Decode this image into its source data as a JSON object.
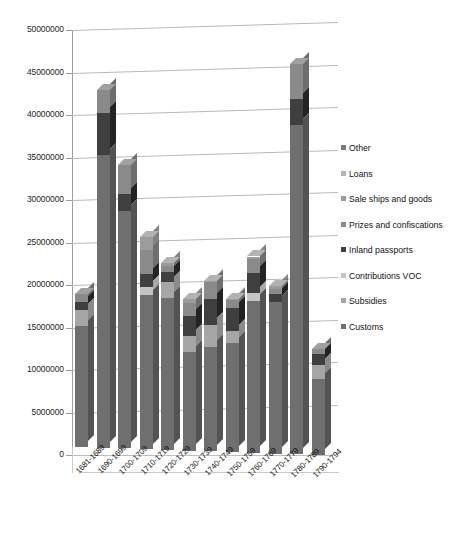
{
  "chart_data": {
    "type": "bar",
    "subtype": "stacked-column-3d",
    "title": "",
    "xlabel": "",
    "ylabel": "",
    "ylim": [
      0,
      50000000
    ],
    "ytick_step": 5000000,
    "ytick_labels": [
      "0",
      "5000000",
      "10000000",
      "15000000",
      "20000000",
      "25000000",
      "30000000",
      "35000000",
      "40000000",
      "45000000",
      "50000000"
    ],
    "grid": true,
    "legend_position": "right",
    "categories": [
      "1681-1689",
      "1690-1699",
      "1700-1709",
      "1710-1719",
      "1720-1729",
      "1730-1739",
      "1740-1749",
      "1750-1759",
      "1760-1769",
      "1770-1779",
      "1780-1789",
      "1790-1794"
    ],
    "series": [
      {
        "name": "Customs",
        "color": "#6f6f6f",
        "values": [
          14200000,
          34400000,
          27900000,
          18100000,
          17900000,
          11600000,
          12300000,
          12800000,
          17900000,
          17800000,
          38700000,
          9000000
        ]
      },
      {
        "name": "Subsidies",
        "color": "#a6a6a6",
        "values": [
          1900000,
          0,
          0,
          0,
          1800000,
          1900000,
          2600000,
          1400000,
          0,
          0,
          0,
          1600000
        ]
      },
      {
        "name": "Contributions VOC",
        "color": "#c4c4c4",
        "values": [
          0,
          0,
          0,
          1000000,
          0,
          0,
          0,
          0,
          900000,
          0,
          0,
          0
        ]
      },
      {
        "name": "Inland passports",
        "color": "#3f3f3f",
        "values": [
          1000000,
          5000000,
          2000000,
          1500000,
          1200000,
          2400000,
          3000000,
          2700000,
          2400000,
          1000000,
          3100000,
          1300000
        ]
      },
      {
        "name": "Prizes and confiscations",
        "color": "#8a8a8a",
        "values": [
          900000,
          2700000,
          3400000,
          2800000,
          700000,
          1500000,
          2000000,
          1000000,
          1600000,
          600000,
          4100000,
          600000
        ]
      },
      {
        "name": "Sale ships and goods",
        "color": "#9c9c9c",
        "values": [
          0,
          0,
          0,
          1600000,
          400000,
          400000,
          100000,
          100000,
          300000,
          300000,
          0,
          0
        ]
      },
      {
        "name": "Loans",
        "color": "#b5b5b5",
        "values": [
          0,
          0,
          0,
          0,
          0,
          0,
          0,
          0,
          0,
          0,
          0,
          0
        ]
      },
      {
        "name": "Other",
        "color": "#7b7b7b",
        "values": [
          0,
          0,
          0,
          0,
          0,
          0,
          0,
          0,
          0,
          0,
          0,
          0
        ]
      }
    ],
    "totals": [
      18000000,
      42100000,
      33300000,
      25000000,
      22000000,
      17800000,
      20000000,
      18000000,
      23100000,
      19700000,
      45900000,
      12500000
    ]
  },
  "legend": {
    "items": [
      {
        "label": "Other",
        "color": "#7b7b7b"
      },
      {
        "label": "Loans",
        "color": "#b5b5b5"
      },
      {
        "label": "Sale ships and goods",
        "color": "#9c9c9c"
      },
      {
        "label": "Prizes and confiscations",
        "color": "#8a8a8a"
      },
      {
        "label": "Inland passports",
        "color": "#3f3f3f"
      },
      {
        "label": "Contributions VOC",
        "color": "#c4c4c4"
      },
      {
        "label": "Subsidies",
        "color": "#a6a6a6"
      },
      {
        "label": "Customs",
        "color": "#6f6f6f"
      }
    ]
  },
  "caption": {
    "text": ""
  }
}
